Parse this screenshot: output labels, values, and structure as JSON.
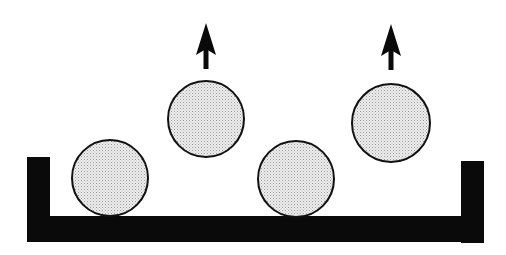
{
  "diagram": {
    "colors": {
      "background": "#ffffff",
      "tray": "#0a0a0a",
      "ball_fill": "#e2e2e2",
      "ball_stroke": "#111111",
      "arrow": "#0a0a0a"
    },
    "tray": {
      "left_wall": {
        "x": 27,
        "y": 157,
        "w": 23,
        "h": 85
      },
      "right_wall": {
        "x": 461,
        "y": 161,
        "w": 23,
        "h": 82
      },
      "base": {
        "x": 27,
        "y": 216,
        "w": 457,
        "h": 26
      }
    },
    "balls": [
      {
        "id": "ball-1",
        "cx": 110,
        "cy": 178,
        "r": 38,
        "state": "resting"
      },
      {
        "id": "ball-2",
        "cx": 206,
        "cy": 119,
        "r": 38,
        "state": "lifted"
      },
      {
        "id": "ball-3",
        "cx": 296,
        "cy": 179,
        "r": 38,
        "state": "resting"
      },
      {
        "id": "ball-4",
        "cx": 391,
        "cy": 123,
        "r": 39,
        "state": "lifted"
      }
    ],
    "arrows": [
      {
        "id": "arrow-1",
        "x": 206,
        "tip_y": 23,
        "tail_y": 69,
        "direction": "up"
      },
      {
        "id": "arrow-2",
        "x": 391,
        "tip_y": 24,
        "tail_y": 70,
        "direction": "up"
      }
    ]
  }
}
